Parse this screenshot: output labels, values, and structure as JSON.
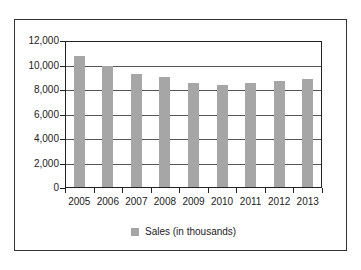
{
  "chart_data": {
    "type": "bar",
    "title": "",
    "xlabel": "",
    "ylabel": "",
    "categories": [
      "2005",
      "2006",
      "2007",
      "2008",
      "2009",
      "2010",
      "2011",
      "2012",
      "2013"
    ],
    "series": [
      {
        "name": "Sales (in thousands)",
        "values": [
          10800,
          10000,
          9270,
          9100,
          8600,
          8400,
          8600,
          8750,
          8900
        ],
        "color": "#a6a6a6"
      }
    ],
    "ylim": [
      0,
      12000
    ],
    "yticks": [
      "0",
      "2,000",
      "4,000",
      "6,000",
      "8,000",
      "10,000",
      "12,000"
    ],
    "grid": true,
    "legend_position": "bottom"
  },
  "legend": {
    "label": "Sales (in thousands)"
  }
}
